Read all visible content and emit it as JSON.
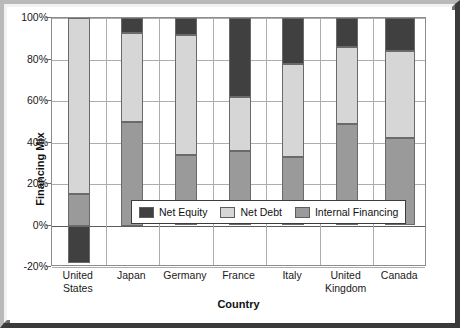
{
  "chart_data": {
    "type": "bar",
    "subtype": "stacked-bar",
    "title": "",
    "xlabel": "Country",
    "ylabel": "Financing Mix",
    "ylim": [
      -20,
      100
    ],
    "yticks": [
      "100%",
      "80%",
      "60%",
      "40%",
      "20%",
      "0%",
      "-20%"
    ],
    "ytick_values": [
      100,
      80,
      60,
      40,
      20,
      0,
      -20
    ],
    "ytick_format": "percent",
    "grid": true,
    "legend_position": "inside-center-lower",
    "categories": [
      "United States",
      "Japan",
      "Germany",
      "France",
      "Italy",
      "United Kingdom",
      "Canada"
    ],
    "series": [
      {
        "name": "Net Equity",
        "color": "#404040",
        "values": [
          -18,
          7,
          8,
          38,
          22,
          14,
          16
        ]
      },
      {
        "name": "Net Debt",
        "color": "#d6d6d6",
        "values": [
          85,
          43,
          58,
          26,
          45,
          37,
          42
        ]
      },
      {
        "name": "Internal Financing",
        "color": "#9a9a9a",
        "values": [
          15,
          50,
          34,
          36,
          33,
          49,
          42
        ]
      }
    ],
    "stack_segments": [
      {
        "category": "United States",
        "segments": [
          {
            "series": "Net Equity",
            "from": -18,
            "to": 0
          },
          {
            "series": "Internal Financing",
            "from": 0,
            "to": 15
          },
          {
            "series": "Net Debt",
            "from": 15,
            "to": 100
          }
        ]
      },
      {
        "category": "Japan",
        "segments": [
          {
            "series": "Internal Financing",
            "from": 0,
            "to": 50
          },
          {
            "series": "Net Debt",
            "from": 50,
            "to": 93
          },
          {
            "series": "Net Equity",
            "from": 93,
            "to": 100
          }
        ]
      },
      {
        "category": "Germany",
        "segments": [
          {
            "series": "Internal Financing",
            "from": 0,
            "to": 34
          },
          {
            "series": "Net Debt",
            "from": 34,
            "to": 92
          },
          {
            "series": "Net Equity",
            "from": 92,
            "to": 100
          }
        ]
      },
      {
        "category": "France",
        "segments": [
          {
            "series": "Internal Financing",
            "from": 0,
            "to": 36
          },
          {
            "series": "Net Debt",
            "from": 36,
            "to": 62
          },
          {
            "series": "Net Equity",
            "from": 62,
            "to": 100
          }
        ]
      },
      {
        "category": "Italy",
        "segments": [
          {
            "series": "Internal Financing",
            "from": 0,
            "to": 33
          },
          {
            "series": "Net Debt",
            "from": 33,
            "to": 78
          },
          {
            "series": "Net Equity",
            "from": 78,
            "to": 100
          }
        ]
      },
      {
        "category": "United Kingdom",
        "segments": [
          {
            "series": "Internal Financing",
            "from": 0,
            "to": 49
          },
          {
            "series": "Net Debt",
            "from": 49,
            "to": 86
          },
          {
            "series": "Net Equity",
            "from": 86,
            "to": 100
          }
        ]
      },
      {
        "category": "Canada",
        "segments": [
          {
            "series": "Internal Financing",
            "from": 0,
            "to": 42
          },
          {
            "series": "Net Debt",
            "from": 42,
            "to": 84
          },
          {
            "series": "Net Equity",
            "from": 84,
            "to": 100
          }
        ]
      }
    ]
  },
  "axes": {
    "ylabel": "Financing Mix",
    "xlabel": "Country",
    "yticks": [
      "100%",
      "80%",
      "60%",
      "40%",
      "20%",
      "0%",
      "-20%"
    ],
    "xticks": [
      [
        "United",
        "States"
      ],
      [
        "Japan"
      ],
      [
        "Germany"
      ],
      [
        "France"
      ],
      [
        "Italy"
      ],
      [
        "United",
        "Kingdom"
      ],
      [
        "Canada"
      ]
    ]
  },
  "legend": {
    "items": [
      {
        "label": "Net Equity",
        "swatch": "equity"
      },
      {
        "label": "Net Debt",
        "swatch": "debt"
      },
      {
        "label": "Internal Financing",
        "swatch": "internal"
      }
    ]
  }
}
